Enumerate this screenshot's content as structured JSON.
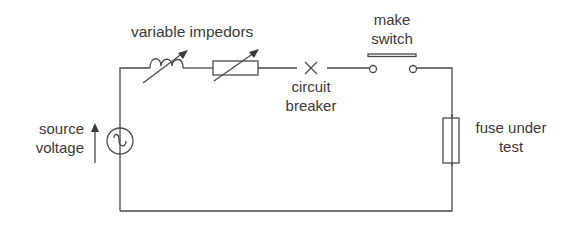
{
  "diagram": {
    "type": "circuit",
    "labels": {
      "variable_impedors": "variable impedors",
      "make_switch_line1": "make",
      "make_switch_line2": "switch",
      "circuit_breaker_line1": "circuit",
      "circuit_breaker_line2": "breaker",
      "source_voltage_line1": "source",
      "source_voltage_line2": "voltage",
      "fuse_line1": "fuse under",
      "fuse_line2": "test"
    },
    "components": [
      {
        "name": "source",
        "symbol": "ac-source-icon"
      },
      {
        "name": "variable inductor",
        "symbol": "variable-inductor-icon"
      },
      {
        "name": "variable resistor",
        "symbol": "variable-resistor-icon"
      },
      {
        "name": "circuit breaker",
        "symbol": "breaker-x-icon"
      },
      {
        "name": "make switch",
        "symbol": "push-switch-icon"
      },
      {
        "name": "fuse under test",
        "symbol": "fuse-icon"
      }
    ],
    "colors": {
      "line": "#4a4a4a",
      "text": "#3a3a3a",
      "background": "#ffffff"
    }
  }
}
